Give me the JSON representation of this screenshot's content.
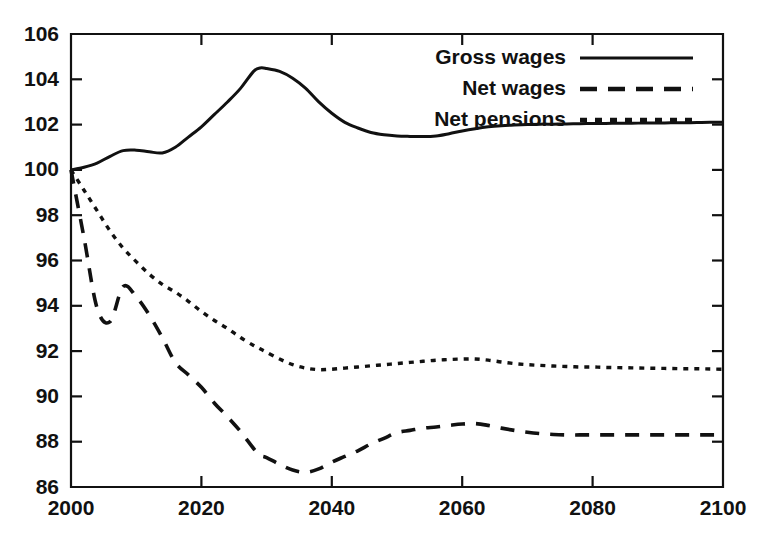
{
  "chart_data": {
    "type": "line",
    "title": "",
    "subtitle": "",
    "xlabel": "",
    "ylabel": "",
    "xlim": [
      2000,
      2100
    ],
    "ylim": [
      86,
      106
    ],
    "xticks": [
      2000,
      2020,
      2040,
      2060,
      2080,
      2100
    ],
    "xtick_labels": [
      "2000",
      "2020",
      "2040",
      "2060",
      "2080",
      "2100"
    ],
    "yticks": [
      86,
      88,
      90,
      92,
      94,
      96,
      98,
      100,
      102,
      104,
      106
    ],
    "ytick_labels": [
      "86",
      "88",
      "90",
      "92",
      "94",
      "96",
      "98",
      "100",
      "102",
      "104",
      "106"
    ],
    "grid": false,
    "legend_position": "top-right",
    "x": [
      2000,
      2002,
      2004,
      2006,
      2008,
      2010,
      2012,
      2014,
      2016,
      2018,
      2020,
      2022,
      2024,
      2026,
      2028,
      2029,
      2030,
      2032,
      2034,
      2036,
      2038,
      2040,
      2042,
      2044,
      2046,
      2048,
      2050,
      2052,
      2054,
      2056,
      2058,
      2060,
      2062,
      2064,
      2066,
      2068,
      2070,
      2072,
      2074,
      2076,
      2078,
      2080,
      2082,
      2084,
      2086,
      2088,
      2090,
      2092,
      2094,
      2096,
      2098,
      2100
    ],
    "series": [
      {
        "name": "Gross wages",
        "style": "solid",
        "values": [
          100.0,
          100.12,
          100.3,
          100.6,
          100.85,
          100.87,
          100.8,
          100.75,
          101.0,
          101.45,
          101.9,
          102.45,
          103.0,
          103.6,
          104.35,
          104.5,
          104.48,
          104.35,
          104.05,
          103.6,
          103.0,
          102.5,
          102.1,
          101.85,
          101.65,
          101.55,
          101.5,
          101.48,
          101.47,
          101.5,
          101.6,
          101.72,
          101.82,
          101.9,
          101.95,
          101.98,
          102.0,
          102.02,
          102.02,
          102.03,
          102.04,
          102.05,
          102.05,
          102.06,
          102.06,
          102.07,
          102.07,
          102.08,
          102.08,
          102.09,
          102.1,
          102.1
        ]
      },
      {
        "name": "Net wages",
        "style": "dashed",
        "values": [
          100.0,
          97.0,
          93.9,
          93.3,
          94.85,
          94.4,
          93.6,
          92.6,
          91.5,
          90.95,
          90.4,
          89.7,
          89.1,
          88.45,
          87.7,
          87.4,
          87.3,
          87.0,
          86.75,
          86.65,
          86.8,
          87.1,
          87.35,
          87.6,
          87.9,
          88.15,
          88.4,
          88.5,
          88.6,
          88.65,
          88.72,
          88.78,
          88.8,
          88.72,
          88.6,
          88.5,
          88.42,
          88.36,
          88.32,
          88.3,
          88.3,
          88.3,
          88.3,
          88.3,
          88.3,
          88.3,
          88.3,
          88.3,
          88.3,
          88.3,
          88.3,
          88.3
        ]
      },
      {
        "name": "Net pensions",
        "style": "dotted",
        "values": [
          100.0,
          99.1,
          98.2,
          97.3,
          96.55,
          95.95,
          95.4,
          94.95,
          94.6,
          94.2,
          93.75,
          93.35,
          93.0,
          92.6,
          92.25,
          92.1,
          91.95,
          91.65,
          91.4,
          91.25,
          91.18,
          91.2,
          91.25,
          91.3,
          91.35,
          91.4,
          91.45,
          91.5,
          91.55,
          91.6,
          91.63,
          91.65,
          91.65,
          91.6,
          91.52,
          91.45,
          91.4,
          91.37,
          91.34,
          91.32,
          91.3,
          91.3,
          91.28,
          91.27,
          91.26,
          91.25,
          91.24,
          91.23,
          91.22,
          91.22,
          91.21,
          91.2
        ]
      }
    ]
  },
  "legend": {
    "items": [
      {
        "label": "Gross wages",
        "style": "solid"
      },
      {
        "label": "Net wages",
        "style": "dashed"
      },
      {
        "label": "Net pensions",
        "style": "dotted"
      }
    ]
  },
  "colors": {
    "ink": "#111111",
    "background": "#ffffff"
  }
}
